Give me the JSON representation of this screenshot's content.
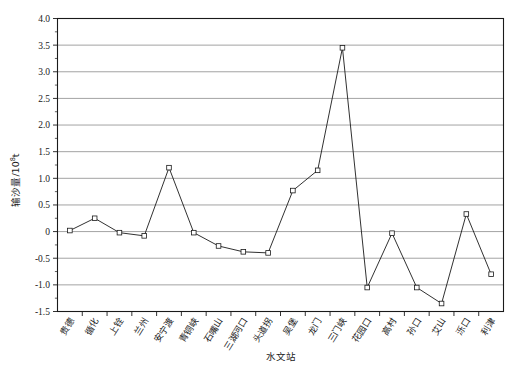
{
  "chart_data": {
    "type": "line",
    "title": "",
    "xlabel": "水文站",
    "ylabel": "输沙量/10",
    "ylabel_exponent": "8",
    "ylabel_unit": "t",
    "categories": [
      "贵德",
      "循化",
      "上铨",
      "兰州",
      "安宁渡",
      "青铜峡",
      "石嘴山",
      "三湖河口",
      "头道拐",
      "吴堡",
      "龙门",
      "三门峡",
      "花园口",
      "高村",
      "孙口",
      "艾山",
      "泺口",
      "利津"
    ],
    "values": [
      0.02,
      0.25,
      -0.02,
      -0.08,
      1.2,
      -0.02,
      -0.27,
      -0.38,
      -0.4,
      0.77,
      1.15,
      3.45,
      -1.05,
      -0.03,
      -1.05,
      -1.35,
      0.33,
      -0.8
    ],
    "ylim": [
      -1.5,
      4.0
    ],
    "ytick_values": [
      4.0,
      3.5,
      3.0,
      2.5,
      2.0,
      1.5,
      1.0,
      0.5,
      0.0,
      -0.5,
      -1.0,
      -1.5
    ],
    "ytick_labels": [
      "4.0",
      "3.5",
      "3.0",
      "2.5",
      "2.0",
      "1.5",
      "1.0",
      "0.5",
      "0",
      "-0.5",
      "-1.0",
      "-1.5"
    ],
    "grid": true,
    "grid_axis": "y",
    "legend": "none",
    "marker": "open-square",
    "line_color": "#1a1a1a",
    "marker_fill": "#ffffff",
    "grid_color": "#8c8c8c",
    "background_color": "#ffffff"
  }
}
